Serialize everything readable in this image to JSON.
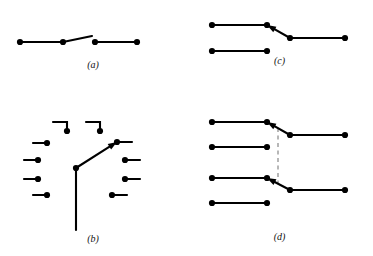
{
  "figure": {
    "background_color": "#ffffff",
    "stroke_color": "#000000",
    "dashed_color": "#999999",
    "panels": [
      {
        "id": "a",
        "label": "(a)",
        "description": "single broken horizontal contour with a slanted jog"
      },
      {
        "id": "b",
        "label": "(b)",
        "description": "radial arrangement of short edge segments around a central arrow"
      },
      {
        "id": "c",
        "label": "(c)",
        "description": "two horizontal contours joined by a down-right arrow connector"
      },
      {
        "id": "d",
        "label": "(d)",
        "description": "four horizontal contours with two arrow connectors linked by a dashed vertical line"
      }
    ]
  },
  "chart_data": {
    "type": "diagram",
    "title": "",
    "panels": {
      "a": {
        "label": "(a)",
        "dots": [
          {
            "x": 20,
            "y": 42
          },
          {
            "x": 63,
            "y": 42
          },
          {
            "x": 95,
            "y": 42
          },
          {
            "x": 137,
            "y": 42
          }
        ],
        "polylines": [
          {
            "name": "left-contour",
            "points": "20,42 63,42"
          },
          {
            "name": "jog-segment",
            "points": "63,42 92,36"
          },
          {
            "name": "right-contour",
            "points": "95,42 137,42"
          }
        ],
        "dashed": [],
        "arrows": []
      },
      "b": {
        "label": "(b)",
        "dots": [
          {
            "x": 67,
            "y": 31
          },
          {
            "x": 100,
            "y": 31
          },
          {
            "x": 47,
            "y": 43
          },
          {
            "x": 38,
            "y": 60
          },
          {
            "x": 38,
            "y": 79
          },
          {
            "x": 47,
            "y": 95
          },
          {
            "x": 117,
            "y": 42
          },
          {
            "x": 125,
            "y": 60
          },
          {
            "x": 125,
            "y": 79
          },
          {
            "x": 112,
            "y": 95
          },
          {
            "x": 76,
            "y": 68
          }
        ],
        "polylines": [
          {
            "name": "top-left-elbow",
            "points": "53,22 67,22 67,31"
          },
          {
            "name": "top-right-elbow",
            "points": "86,22 100,22 100,31"
          },
          {
            "name": "left-seg-1",
            "points": "33,43 47,43"
          },
          {
            "name": "left-seg-2",
            "points": "24,60 38,60"
          },
          {
            "name": "left-seg-3",
            "points": "24,79 38,79"
          },
          {
            "name": "left-seg-4",
            "points": "33,95 47,95"
          },
          {
            "name": "right-seg-1",
            "points": "117,42 132,42"
          },
          {
            "name": "right-seg-2",
            "points": "125,60 140,60"
          },
          {
            "name": "right-seg-3",
            "points": "125,79 140,79"
          },
          {
            "name": "right-seg-4",
            "points": "112,95 127,95"
          },
          {
            "name": "center-stem",
            "points": "76,68 76,130"
          }
        ],
        "dashed": [],
        "arrows": [
          {
            "name": "center-arrow",
            "from": [
              76,
              68
            ],
            "to": [
              117,
              42
            ]
          }
        ]
      },
      "c": {
        "label": "(c)",
        "dots": [
          {
            "x": 26,
            "y": 25
          },
          {
            "x": 81,
            "y": 25
          },
          {
            "x": 104,
            "y": 38
          },
          {
            "x": 159,
            "y": 38
          },
          {
            "x": 26,
            "y": 51
          },
          {
            "x": 81,
            "y": 51
          }
        ],
        "polylines": [
          {
            "name": "upper-left-contour",
            "points": "26,25 81,25"
          },
          {
            "name": "lower-right-contour",
            "points": "104,38 159,38"
          },
          {
            "name": "lower-left-contour",
            "points": "26,51 81,51"
          }
        ],
        "dashed": [],
        "arrows": [
          {
            "name": "connector-arrow-c",
            "from": [
              104,
              38
            ],
            "to": [
              81,
              25
            ]
          }
        ]
      },
      "d": {
        "label": "(d)",
        "dots": [
          {
            "x": 26,
            "y": 22
          },
          {
            "x": 81,
            "y": 22
          },
          {
            "x": 104,
            "y": 35
          },
          {
            "x": 159,
            "y": 35
          },
          {
            "x": 26,
            "y": 47
          },
          {
            "x": 81,
            "y": 47
          },
          {
            "x": 26,
            "y": 78
          },
          {
            "x": 81,
            "y": 78
          },
          {
            "x": 104,
            "y": 90
          },
          {
            "x": 159,
            "y": 90
          },
          {
            "x": 26,
            "y": 103
          },
          {
            "x": 81,
            "y": 103
          }
        ],
        "polylines": [
          {
            "name": "contour-1-left",
            "points": "26,22 81,22"
          },
          {
            "name": "contour-1-right",
            "points": "104,35 159,35"
          },
          {
            "name": "contour-2-left",
            "points": "26,47 81,47"
          },
          {
            "name": "contour-3-left",
            "points": "26,78 81,78"
          },
          {
            "name": "contour-3-right",
            "points": "104,90 159,90"
          },
          {
            "name": "contour-4-left",
            "points": "26,103 81,103"
          }
        ],
        "dashed": [
          {
            "name": "vertical-dashed-link",
            "points": "92,28 92,84"
          }
        ],
        "arrows": [
          {
            "name": "connector-arrow-d-upper",
            "from": [
              104,
              35
            ],
            "to": [
              81,
              22
            ]
          },
          {
            "name": "connector-arrow-d-lower",
            "from": [
              104,
              90
            ],
            "to": [
              81,
              78
            ]
          }
        ]
      }
    }
  }
}
